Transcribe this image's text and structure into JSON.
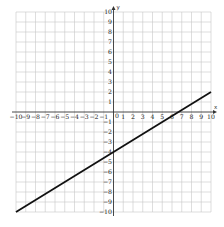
{
  "chart_data": {
    "type": "line",
    "title": "",
    "xlabel": "x",
    "ylabel": "y",
    "xlim": [
      -10,
      10
    ],
    "ylim": [
      -10,
      10
    ],
    "grid": true,
    "x_ticks": [
      -10,
      -9,
      -8,
      -7,
      -6,
      -5,
      -4,
      -3,
      -2,
      -1,
      1,
      2,
      3,
      4,
      5,
      6,
      7,
      8,
      9,
      10
    ],
    "y_ticks": [
      -10,
      -9,
      -8,
      -7,
      -6,
      -5,
      -4,
      -3,
      -2,
      -1,
      1,
      2,
      3,
      4,
      5,
      6,
      7,
      8,
      9,
      10
    ],
    "x_tick_labels": [
      "−10",
      "−9",
      "−8",
      "−7",
      "−6",
      "−5",
      "−4",
      "−3",
      "−2",
      "−1",
      "1",
      "2",
      "3",
      "4",
      "5",
      "6",
      "7",
      "8",
      "9",
      "10"
    ],
    "y_tick_labels": [
      "−10",
      "−9",
      "−8",
      "−7",
      "−6",
      "−5",
      "−4",
      "−3",
      "−2",
      "−1",
      "1",
      "2",
      "3",
      "4",
      "5",
      "6",
      "7",
      "8",
      "9",
      "10"
    ],
    "origin_label": "0",
    "series": [
      {
        "name": "line",
        "equation": "y = 0.6x − 4",
        "slope": 0.6,
        "intercept": -4,
        "x": [
          -10,
          10
        ],
        "y": [
          -10,
          2
        ],
        "color": "#111111"
      }
    ]
  }
}
